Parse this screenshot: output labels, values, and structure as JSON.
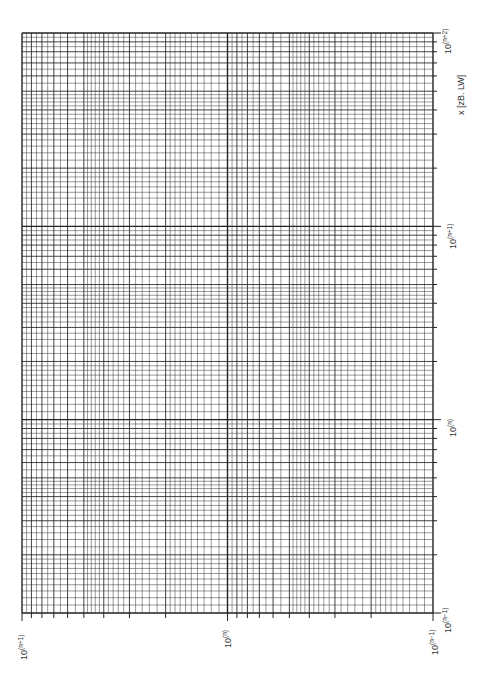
{
  "chart_data": {
    "type": "table",
    "title": "",
    "orientation": "rotated-90",
    "x_axis": {
      "label": "x [zB. LW]",
      "scale": "log",
      "decades": 3,
      "tick_labels": [
        "10^(n-1)",
        "10^(n)",
        "10^(n+1)",
        "10^(n+2)"
      ]
    },
    "y_axis": {
      "label": "",
      "scale": "log",
      "decades": 2,
      "tick_labels": [
        "10^(n-1)",
        "10^(n)",
        "10^(n+1)"
      ]
    },
    "grid": true,
    "line_color": "#222222"
  },
  "labels": {
    "xaxis_title": "x [zB. LW]",
    "x_ticks": [
      {
        "base": "10",
        "exp": "(n+2)"
      },
      {
        "base": "10",
        "exp": "(n+1)"
      },
      {
        "base": "10",
        "exp": "(n)"
      },
      {
        "base": "10",
        "exp": "(n−1)"
      }
    ],
    "y_ticks": [
      {
        "base": "10",
        "exp": "(n+1)"
      },
      {
        "base": "10",
        "exp": "(n)"
      },
      {
        "base": "10",
        "exp": "(n−1)"
      }
    ]
  }
}
